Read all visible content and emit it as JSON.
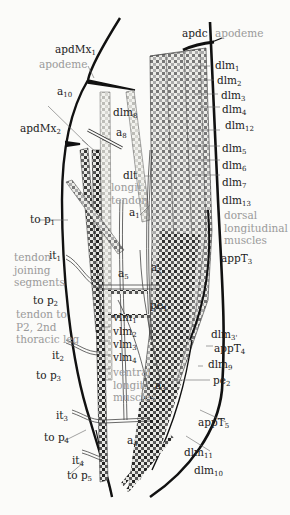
{
  "figure": {
    "colors": {
      "background": "#fbfbf9",
      "outline": "#111111",
      "label": "#222222",
      "grey_label": "#9a9a9a",
      "muscle_dark": "#2a2a2a",
      "muscle_light": "#d9d9d4"
    }
  },
  "labels": {
    "apdMx1": {
      "base": "apdMx",
      "sub": "1"
    },
    "apodeme_left": "apodeme",
    "apdc": "apdc",
    "apodeme_right": "apodeme",
    "a10": {
      "base": "a",
      "sub": "10"
    },
    "dlm8": {
      "base": "dlm",
      "sub": "8"
    },
    "apdMx2": {
      "base": "apdMx",
      "sub": "2"
    },
    "a8": {
      "base": "a",
      "sub": "8"
    },
    "dlt": "dlt",
    "longit_tendon": "longit.\ntendon",
    "a1": {
      "base": "a",
      "sub": "1"
    },
    "to_p1": {
      "base": "to  p",
      "sub": "1"
    },
    "it1": {
      "base": "it",
      "sub": "1"
    },
    "tendon_joining": "tendon\njoining\nsegments",
    "to_p2": {
      "base": "to  p",
      "sub": "2"
    },
    "tendon_to_p2": "tendon to\nP2, 2nd\nthoracic leg",
    "it2": {
      "base": "it",
      "sub": "2"
    },
    "to_p3": {
      "base": "to  p",
      "sub": "3"
    },
    "it3": {
      "base": "it",
      "sub": "3"
    },
    "to_p4": {
      "base": "to  p",
      "sub": "4"
    },
    "it4": {
      "base": "it",
      "sub": "4"
    },
    "to_p5": {
      "base": "to  p",
      "sub": "5"
    },
    "a5": {
      "base": "a",
      "sub": "5"
    },
    "a2": {
      "base": "a",
      "sub": "2"
    },
    "pe1": {
      "base": "pe",
      "sub": "1"
    },
    "vlm1": {
      "base": "vlm",
      "sub": "1"
    },
    "vlm2": {
      "base": "vlm",
      "sub": "2"
    },
    "vlm3": {
      "base": "vlm",
      "sub": "3"
    },
    "vlm4": {
      "base": "vlm",
      "sub": "4"
    },
    "ventral_longit": "ventral\nlongit.\nmuscles",
    "a3": {
      "base": "a",
      "sub": "3"
    },
    "a4": {
      "base": "a",
      "sub": "4"
    },
    "dlm1": {
      "base": "dlm",
      "sub": "1"
    },
    "dlm2": {
      "base": "dlm",
      "sub": "2"
    },
    "dlm3": {
      "base": "dlm",
      "sub": "3"
    },
    "dlm4": {
      "base": "dlm",
      "sub": "4"
    },
    "dlm12": {
      "base": "dlm",
      "sub": "12"
    },
    "dlm5": {
      "base": "dlm",
      "sub": "5"
    },
    "dlm6": {
      "base": "dlm",
      "sub": "6"
    },
    "dlm7": {
      "base": "dlm",
      "sub": "7"
    },
    "dlm13": {
      "base": "dlm",
      "sub": "13"
    },
    "dorsal_longit": "dorsal\nlongitudinal\nmuscles",
    "appT3": {
      "base": "appT",
      "sub": "3"
    },
    "dlm3p": {
      "base": "dlm",
      "sub": "3'"
    },
    "appT4": {
      "base": "appT",
      "sub": "4"
    },
    "dlm9": {
      "base": "dlm",
      "sub": "9"
    },
    "pe2": {
      "base": "pe",
      "sub": "2"
    },
    "appT5": {
      "base": "appT",
      "sub": "5"
    },
    "dlm11": {
      "base": "dlm",
      "sub": "11"
    },
    "dlm10": {
      "base": "dlm",
      "sub": "10"
    }
  }
}
